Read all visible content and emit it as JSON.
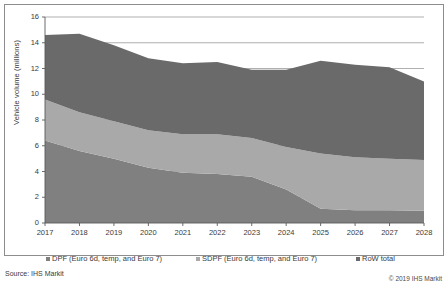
{
  "chart_data": {
    "type": "area",
    "stacked": true,
    "title": "",
    "xlabel": "",
    "ylabel": "Vehicle volume (millions)",
    "categories": [
      "2017",
      "2018",
      "2019",
      "2020",
      "2021",
      "2022",
      "2023",
      "2024",
      "2025",
      "2026",
      "2027",
      "2028"
    ],
    "x_tick_labels": [
      "2017",
      "2018",
      "2019",
      "2020",
      "2021",
      "2022",
      "2023",
      "2024",
      "2025",
      "2026",
      "2027",
      "2028"
    ],
    "y_tick_labels": [
      "0",
      "2",
      "4",
      "6",
      "8",
      "10",
      "12",
      "14",
      "16"
    ],
    "ylim": [
      0,
      16
    ],
    "y_tick_step": 2,
    "grid": "horizontal",
    "legend_position": "bottom",
    "series": [
      {
        "name": "DPF (Euro 6d, temp, and Euro 7)",
        "color": "#808080",
        "values": [
          6.4,
          5.6,
          5.0,
          4.3,
          3.9,
          3.8,
          3.6,
          2.6,
          1.1,
          1.0,
          1.0,
          0.95
        ]
      },
      {
        "name": "SDPF (Euro 6d, temp, and Euro 7)",
        "color": "#a9a9a9",
        "values": [
          3.2,
          3.0,
          2.9,
          2.9,
          3.0,
          3.1,
          3.0,
          3.3,
          4.3,
          4.1,
          4.0,
          3.95
        ]
      },
      {
        "name": "RoW total",
        "color": "#6a6a6a",
        "values": [
          5.0,
          6.1,
          5.9,
          5.6,
          5.5,
          5.6,
          5.3,
          6.0,
          7.2,
          7.2,
          7.1,
          6.1
        ]
      }
    ],
    "stack_totals": [
      14.6,
      14.7,
      13.8,
      12.8,
      12.4,
      12.5,
      11.9,
      11.9,
      12.6,
      12.3,
      12.1,
      11.0
    ]
  },
  "footer": {
    "source": "Source: IHS Markit",
    "copyright": "© 2019 IHS Markit"
  },
  "colors": {
    "dpf": "#808080",
    "sdpf": "#a9a9a9",
    "row": "#6a6a6a",
    "grid": "#8d8d8d",
    "axis": "#5a5a5a",
    "text": "#3a3a3a",
    "background": "#ffffff"
  }
}
